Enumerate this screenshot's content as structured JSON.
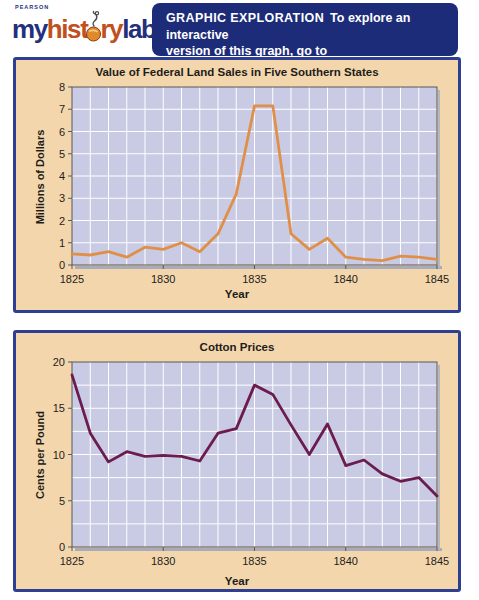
{
  "brand": {
    "imprint": "PEARSON",
    "logo_parts": {
      "my": "my",
      "hist": "hist",
      "ry": "ry",
      "lab": "lab"
    },
    "colors": {
      "navy": "#23307c",
      "rust": "#c0511f",
      "mouse_orange": "#e0892a"
    }
  },
  "header": {
    "bg": "#1d2c78",
    "line1_heading": "GRAPHIC EXPLORATION",
    "line1_rest": "To explore an interactive",
    "line2": "version of this graph, go to",
    "line3_url": "http://www.prenhall.com/goldfield5/fig10.1"
  },
  "panels": {
    "border_color": "#2e3f93",
    "bg": "#f4d6ad"
  },
  "chart_data": [
    {
      "type": "line",
      "title": "Value of Federal Land Sales in Five Southern States",
      "xlabel": "Year",
      "ylabel": "Millions of Dollars",
      "x": [
        1825,
        1826,
        1827,
        1828,
        1829,
        1830,
        1831,
        1832,
        1833,
        1834,
        1835,
        1836,
        1837,
        1838,
        1839,
        1840,
        1841,
        1842,
        1843,
        1844,
        1845
      ],
      "values": [
        0.5,
        0.45,
        0.6,
        0.35,
        0.8,
        0.7,
        1.0,
        0.6,
        1.4,
        3.2,
        7.15,
        7.15,
        1.4,
        0.7,
        1.2,
        0.35,
        0.25,
        0.2,
        0.4,
        0.35,
        0.25
      ],
      "ylim": [
        0,
        8
      ],
      "grid": true,
      "grid_step": 1,
      "label_step": 1,
      "xticks": [
        1825,
        1830,
        1835,
        1840,
        1845
      ],
      "line_color": "#e08f48",
      "plot_bg": "#c8cbe3",
      "grid_color": "#ffffff"
    },
    {
      "type": "line",
      "title": "Cotton Prices",
      "xlabel": "Year",
      "ylabel": "Cents per Pound",
      "x": [
        1825,
        1826,
        1827,
        1828,
        1829,
        1830,
        1831,
        1832,
        1833,
        1834,
        1835,
        1836,
        1837,
        1838,
        1839,
        1840,
        1841,
        1842,
        1843,
        1844,
        1845
      ],
      "values": [
        18.6,
        12.3,
        9.2,
        10.3,
        9.8,
        9.9,
        9.8,
        9.3,
        12.3,
        12.8,
        17.5,
        16.5,
        13.2,
        10.0,
        13.3,
        8.8,
        9.4,
        7.9,
        7.1,
        7.5,
        5.5
      ],
      "ylim": [
        0,
        20
      ],
      "grid": true,
      "grid_step": 2.5,
      "label_step": 5,
      "xticks": [
        1825,
        1830,
        1835,
        1840,
        1845
      ],
      "line_color": "#6b1b4f",
      "plot_bg": "#c8cbe3",
      "grid_color": "#ffffff"
    }
  ]
}
